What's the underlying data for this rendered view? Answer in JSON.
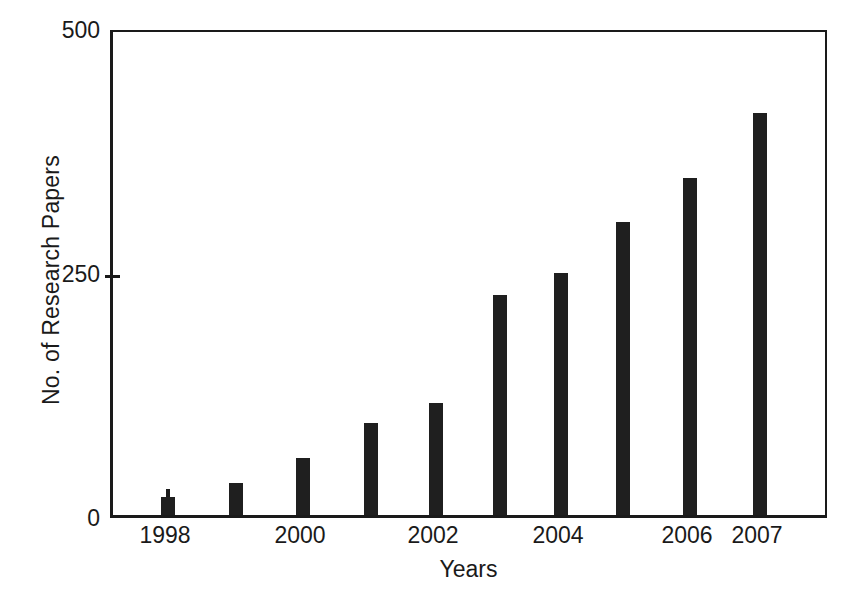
{
  "chart_data": {
    "type": "bar",
    "title": "",
    "xlabel": "Years",
    "ylabel": "No. of Research Papers",
    "categories": [
      "1998",
      "1999",
      "2000",
      "2001",
      "2002",
      "2003",
      "2004",
      "2005",
      "2006",
      "2007"
    ],
    "values": [
      18,
      33,
      58,
      94,
      115,
      225,
      248,
      300,
      345,
      412
    ],
    "ylim": [
      0,
      500
    ],
    "yticks": [
      0,
      250,
      500
    ],
    "ytick_labels": [
      "0",
      "250",
      "500"
    ],
    "xtick_labels_shown": [
      "1998",
      "2000",
      "2002",
      "2004",
      "2006",
      "2007"
    ],
    "xticks_all": [
      "1998",
      "1999",
      "2000",
      "2001",
      "2002",
      "2003",
      "2004",
      "2005",
      "2006",
      "2007"
    ],
    "grid": false,
    "legend": null,
    "bar_color": "#1f1f1f",
    "axis_color": "#1a1a1a",
    "background_color": "#ffffff"
  },
  "axes": {
    "y_title": "No. of Research Papers",
    "x_title": "Years",
    "y_tick_0": "0",
    "y_tick_250": "250",
    "y_tick_500": "500"
  },
  "x_labels": {
    "l1998": "1998",
    "l2000": "2000",
    "l2002": "2002",
    "l2004": "2004",
    "l2006": "2006",
    "l2007": "2007"
  }
}
